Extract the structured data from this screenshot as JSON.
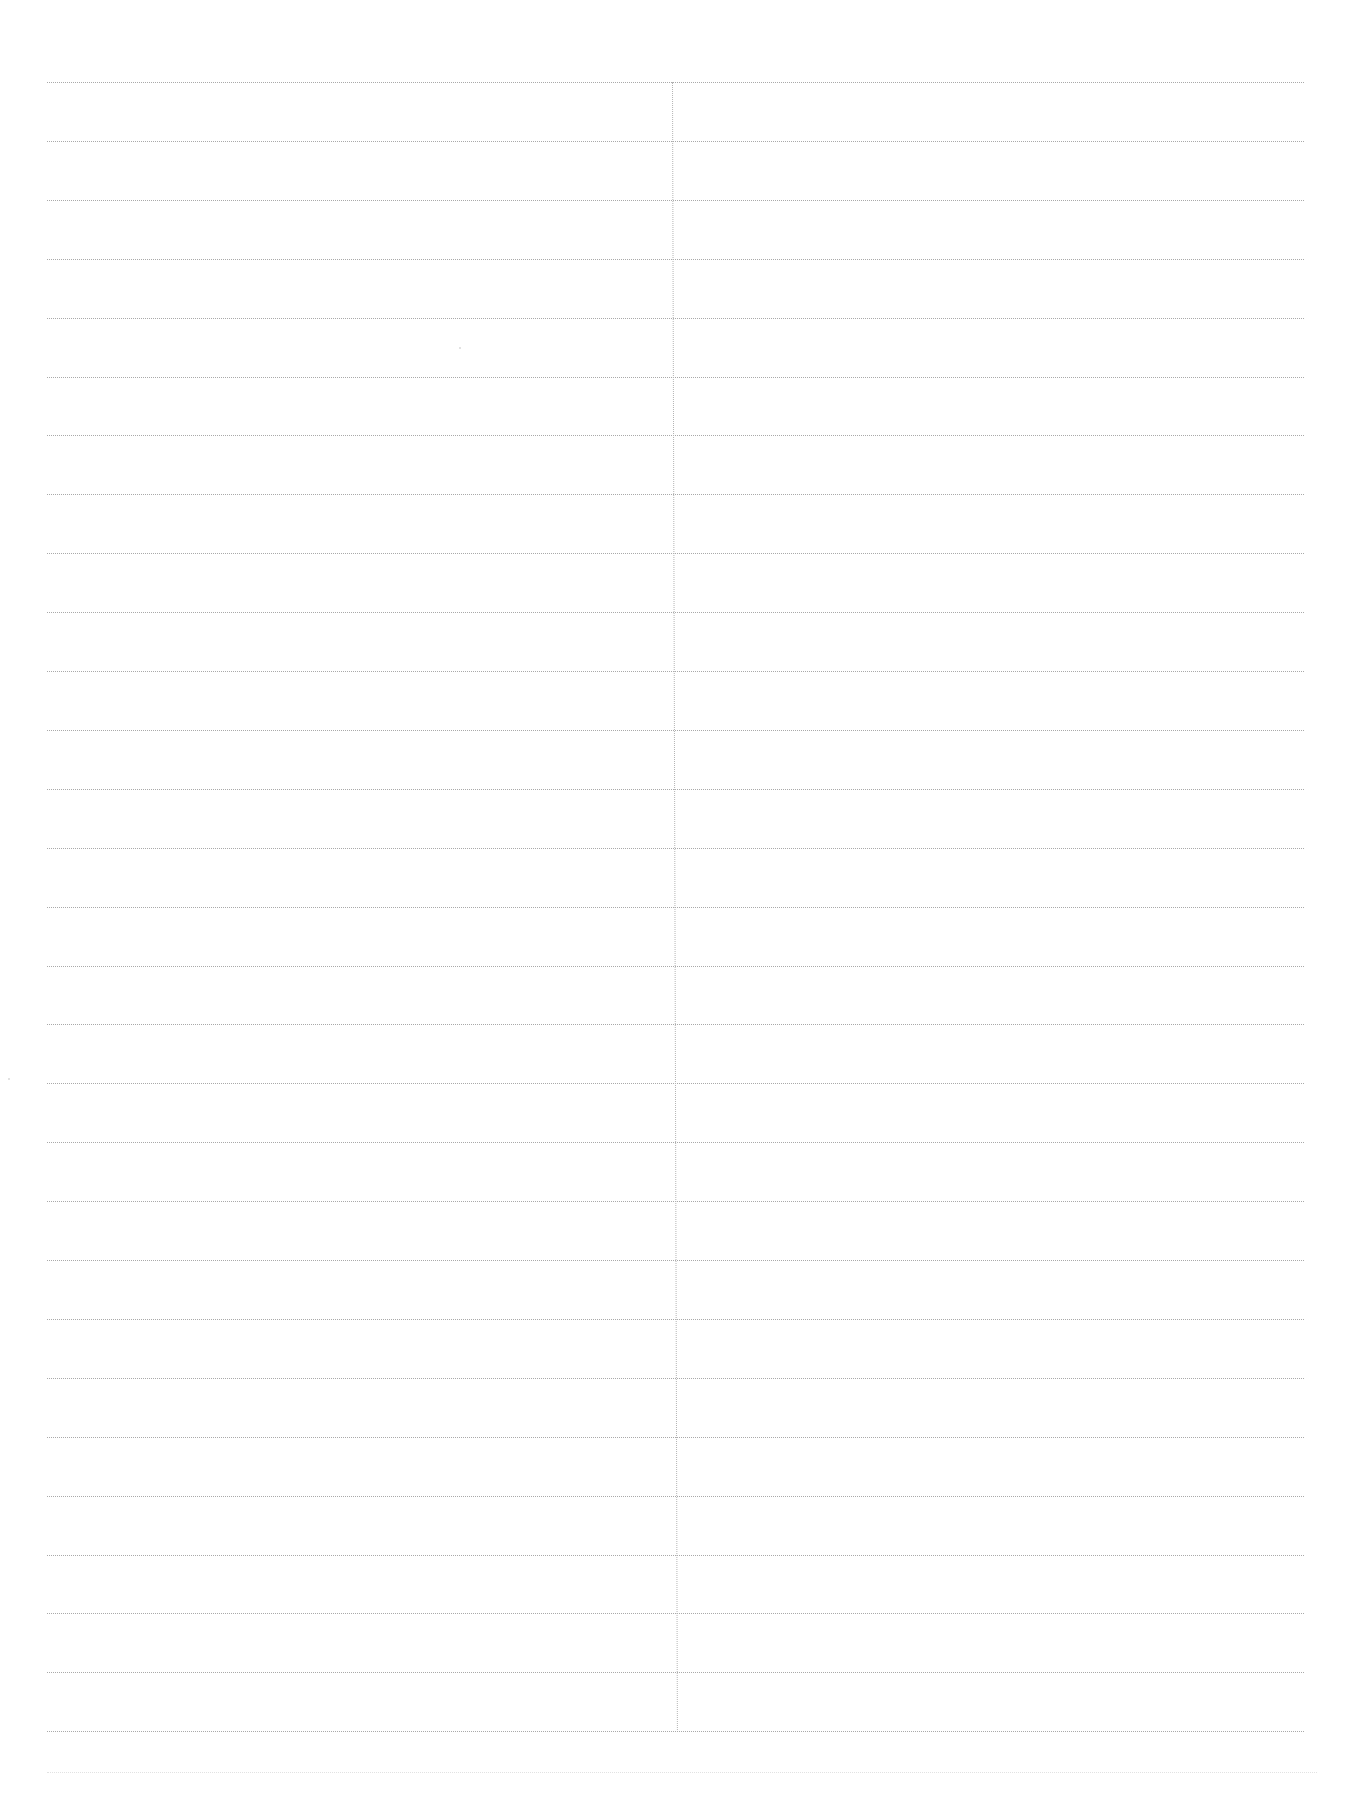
{
  "document": {
    "type": "blank ruled sheet",
    "columns": 2,
    "rule_count": 29,
    "rule_first_y": 82,
    "rule_spacing": 58.9,
    "rule_left": 47,
    "rule_right": 1304,
    "divider_x": 672,
    "divider_top": 82,
    "divider_bottom": 1730,
    "faint_bottom_rule_y": 1772,
    "line_color": "#a9a9a9",
    "background": "#ffffff",
    "text": ""
  }
}
